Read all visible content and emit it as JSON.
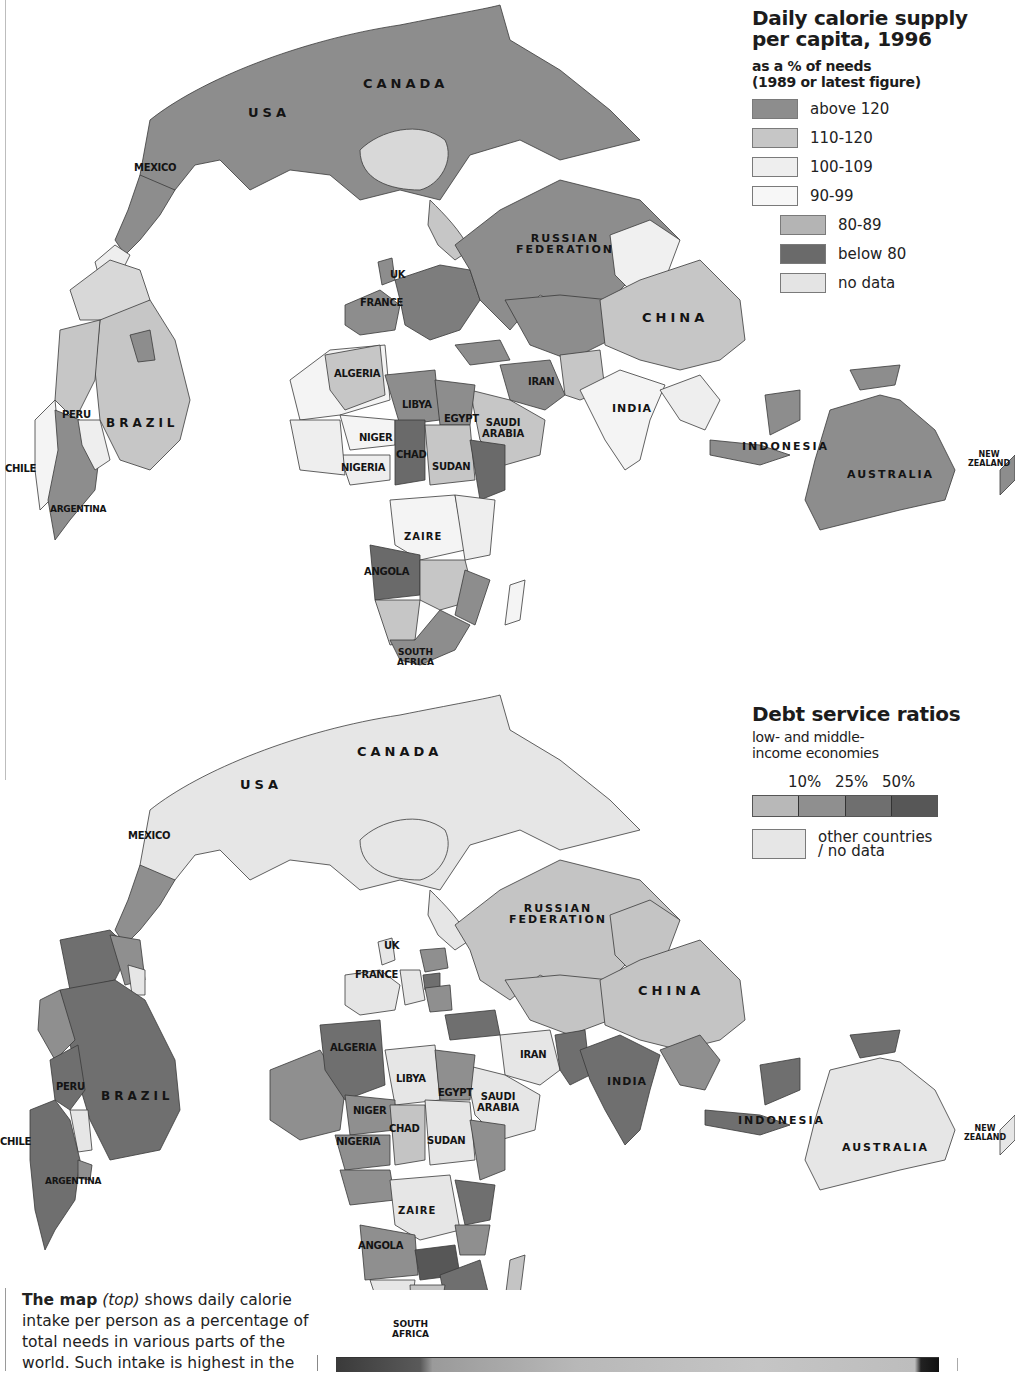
{
  "colors": {
    "calorie": {
      "above_120": "#8d8d8d",
      "110_120": "#c6c6c6",
      "100_109": "#eeeeee",
      "90_99": "#f7f7f7",
      "80_89": "#b4b4b4",
      "below_80": "#6a6a6a",
      "no_data": "#e4e4e4"
    },
    "debt": {
      "d10": "#b8b8b8",
      "d25": "#8f8f8f",
      "d50": "#6f6f6f",
      "d50plus": "#575757",
      "other": "#e6e6e6"
    },
    "border": "#3a3a3a"
  },
  "calorie_map": {
    "legend": {
      "title": "Daily calorie supply per capita, 1996",
      "title_line1": "Daily calorie supply",
      "title_line2": "per capita, 1996",
      "subtitle_line1": "as a % of needs",
      "subtitle_line2": "(1989 or latest figure)",
      "items": [
        {
          "label": "above 120",
          "key": "above_120"
        },
        {
          "label": "110-120",
          "key": "110_120"
        },
        {
          "label": "100-109",
          "key": "100_109"
        },
        {
          "label": "90-99",
          "key": "90_99"
        },
        {
          "label": "80-89",
          "key": "80_89"
        },
        {
          "label": "below 80",
          "key": "below_80"
        },
        {
          "label": "no data",
          "key": "no_data"
        }
      ]
    },
    "labels": {
      "usa": "USA",
      "canada": "CANADA",
      "mexico": "MEXICO",
      "russia_1": "RUSSIAN",
      "russia_2": "FEDERATION",
      "uk": "UK",
      "france": "FRANCE",
      "china": "CHINA",
      "algeria": "ALGERIA",
      "libya": "LIBYA",
      "egypt": "EGYPT",
      "saudi_1": "SAUDI",
      "saudi_2": "ARABIA",
      "iran": "IRAN",
      "india": "INDIA",
      "niger": "NIGER",
      "chad": "CHAD",
      "nigeria": "NIGERIA",
      "sudan": "SUDAN",
      "peru": "PERU",
      "brazil": "BRAZIL",
      "chile": "CHILE",
      "argentina": "ARGENTINA",
      "indonesia": "INDONESIA",
      "australia": "AUSTRALIA",
      "nz_1": "NEW",
      "nz_2": "ZEALAND",
      "zaire": "ZAIRE",
      "angola": "ANGOLA",
      "sa_1": "SOUTH",
      "sa_2": "AFRICA"
    }
  },
  "debt_map": {
    "legend": {
      "title": "Debt service ratios",
      "subtitle_line1": "low- and middle-",
      "subtitle_line2": "income economies",
      "ticks": [
        "10%",
        "25%",
        "50%"
      ],
      "other_line1": "other countries",
      "other_line2": "/ no data"
    },
    "labels": {
      "usa": "USA",
      "canada": "CANADA",
      "mexico": "MEXICO",
      "russia_1": "RUSSIAN",
      "russia_2": "FEDERATION",
      "uk": "UK",
      "france": "FRANCE",
      "china": "CHINA",
      "algeria": "ALGERIA",
      "libya": "LIBYA",
      "egypt": "EGYPT",
      "saudi_1": "SAUDI",
      "saudi_2": "ARABIA",
      "iran": "IRAN",
      "india": "INDIA",
      "niger": "NIGER",
      "chad": "CHAD",
      "nigeria": "NIGERIA",
      "sudan": "SUDAN",
      "peru": "PERU",
      "brazil": "BRAZIL",
      "chile": "CHILE",
      "argentina": "ARGENTINA",
      "indonesia": "INDONESIA",
      "australia": "AUSTRALIA",
      "nz_1": "NEW",
      "nz_2": "ZEALAND",
      "zaire": "ZAIRE",
      "angola": "ANGOLA",
      "sa_1": "SOUTH",
      "sa_2": "AFRICA"
    }
  },
  "caption": {
    "lead": "The map",
    "paren": "(top)",
    "text": " shows daily calorie intake per person as a percentage of total needs in various parts of the world. Such intake is highest in the"
  }
}
